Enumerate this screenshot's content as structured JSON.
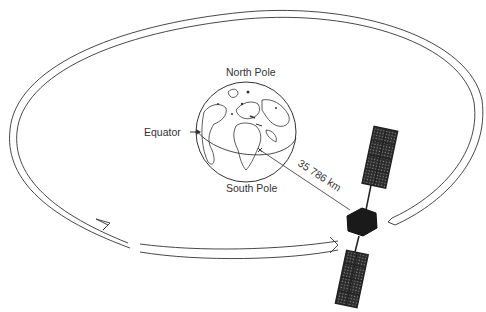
{
  "diagram": {
    "labels": {
      "north_pole": "North Pole",
      "south_pole": "South Pole",
      "equator": "Equator",
      "distance": "35 786 km"
    },
    "colors": {
      "line": "#333333",
      "satellite_body": "#1a1a1a",
      "panel": "#2a2a2a",
      "background": "#ffffff"
    }
  }
}
